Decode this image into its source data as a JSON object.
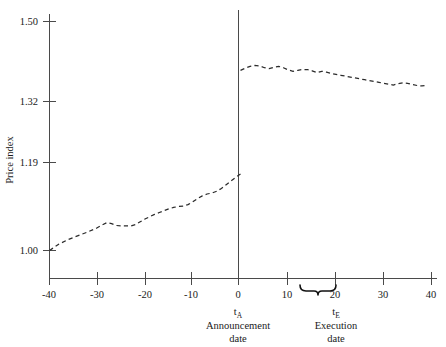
{
  "chart_data": {
    "type": "line",
    "title": "",
    "subtitle": "",
    "xlabel": "Trading days",
    "ylabel": "Price index",
    "xlim": [
      -42,
      41
    ],
    "ylim": [
      1.0,
      1.5
    ],
    "grid": false,
    "legend": "none",
    "y_ticks": [
      "1.00",
      "1.19",
      "1.32",
      "1.50"
    ],
    "y_tick_values": [
      1.0,
      1.19,
      1.32,
      1.5
    ],
    "x_ticks": [
      "-40",
      "-30",
      "-20",
      "-10",
      "0",
      "10",
      "20",
      "30",
      "40"
    ],
    "x_tick_values": [
      -40,
      -30,
      -20,
      -10,
      0,
      10,
      20,
      30,
      40
    ],
    "series": [
      {
        "name": "Price index before announcement",
        "style": "dashed",
        "color": "#2b2b2b",
        "x": [
          -40,
          -38,
          -36,
          -34,
          -32,
          -30,
          -29,
          -28,
          -27,
          -26,
          -25,
          -24,
          -23,
          -22,
          -21,
          -20,
          -19,
          -18,
          -17,
          -16,
          -15,
          -14,
          -13,
          -12,
          -11,
          -10,
          -9,
          -8,
          -7,
          -6,
          -5,
          -4,
          -3,
          -2,
          -1,
          0
        ],
        "y": [
          1.0,
          1.014,
          1.024,
          1.032,
          1.04,
          1.049,
          1.055,
          1.06,
          1.058,
          1.054,
          1.053,
          1.053,
          1.053,
          1.056,
          1.062,
          1.068,
          1.073,
          1.078,
          1.082,
          1.086,
          1.09,
          1.093,
          1.095,
          1.096,
          1.099,
          1.105,
          1.112,
          1.118,
          1.122,
          1.124,
          1.128,
          1.134,
          1.142,
          1.15,
          1.158,
          1.165
        ]
      },
      {
        "name": "Price index after announcement",
        "style": "dashed",
        "color": "#2b2b2b",
        "x": [
          0,
          1,
          2,
          3,
          4,
          5,
          6,
          7,
          8,
          9,
          10,
          11,
          12,
          13,
          14,
          15,
          16,
          17,
          18,
          19,
          20,
          21,
          22,
          23,
          24,
          25,
          26,
          27,
          28,
          29,
          30,
          31,
          32,
          33,
          34,
          35,
          36,
          37,
          38,
          39
        ],
        "y": [
          1.39,
          1.395,
          1.399,
          1.401,
          1.4,
          1.396,
          1.394,
          1.397,
          1.399,
          1.396,
          1.391,
          1.388,
          1.39,
          1.392,
          1.392,
          1.389,
          1.385,
          1.388,
          1.386,
          1.383,
          1.381,
          1.379,
          1.377,
          1.375,
          1.373,
          1.371,
          1.369,
          1.367,
          1.365,
          1.363,
          1.361,
          1.359,
          1.357,
          1.36,
          1.362,
          1.361,
          1.358,
          1.356,
          1.355,
          1.356
        ]
      }
    ],
    "annotations": [
      {
        "name": "announcement-marker",
        "at_x": 0,
        "marker": "vertical-line",
        "symbol": "t",
        "subscript": "A",
        "line1": "Announcement",
        "line2": "date"
      },
      {
        "name": "execution-marker",
        "at_x": 16.5,
        "span_x": [
          13,
          20
        ],
        "marker": "brace",
        "symbol": "t",
        "subscript": "E",
        "line1": "Execution",
        "line2": "date"
      }
    ]
  },
  "axes": {
    "y_title": "Price index",
    "x_title": "Trading days"
  },
  "labels": {
    "y_1_50": "1.50",
    "y_1_32": "1.32",
    "y_1_19": "1.19",
    "y_1_00": "1.00",
    "x_m40": "-40",
    "x_m30": "-30",
    "x_m20": "-20",
    "x_m10": "-10",
    "x_0": "0",
    "x_10": "10",
    "x_20": "20",
    "x_30": "30",
    "x_40": "40",
    "trading_days": "Trading days",
    "t_symbol_a": "t",
    "t_sub_a": "A",
    "announcement": "Announcement",
    "announcement_date": "date",
    "t_symbol_e": "t",
    "t_sub_e": "E",
    "execution": "Execution",
    "execution_date": "date"
  },
  "colors": {
    "series": "#2b2b2b",
    "axis": "#4a4a4a",
    "text": "#1a1a1a",
    "background": "#ffffff"
  }
}
